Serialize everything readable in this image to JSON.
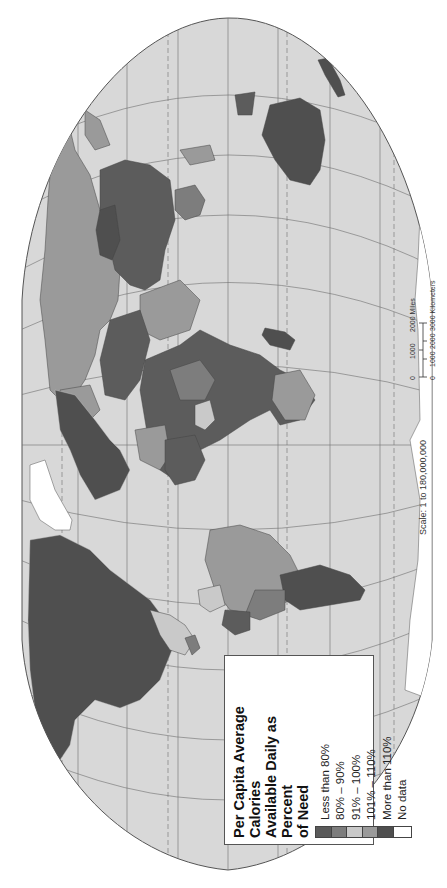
{
  "map": {
    "projection": "rotated equal-area world projection with graticule",
    "background_color": "#ffffff",
    "ocean_color": "#d8d8d8",
    "graticule_color": "#6a6a6a"
  },
  "legend": {
    "title": "Per Capita Average Calories Available Daily as Percent of Need",
    "title_lines": [
      "Per Capita Average Calories",
      "Available Daily as Percent",
      "of Need"
    ],
    "items": [
      {
        "label": "Less than 80%",
        "color": "#5a5a5a"
      },
      {
        "label": "80% – 90%",
        "color": "#7d7d7d"
      },
      {
        "label": "91% – 100%",
        "color": "#c9c9c9"
      },
      {
        "label": "101% – 110%",
        "color": "#9a9a9a"
      },
      {
        "label": "More than 110%",
        "color": "#4f4f4f"
      },
      {
        "label": "No data",
        "color": "#ffffff"
      }
    ]
  },
  "scale": {
    "ratio_text": "Scale: 1 to 180,000,000",
    "miles": {
      "ticks": [
        "0",
        "1000",
        "2000"
      ],
      "unit": "2000 Miles",
      "label": "Miles"
    },
    "kilometers": {
      "ticks": [
        "0",
        "1000",
        "2000",
        "3000"
      ],
      "unit": "3000 Kilometers",
      "label": "Kilometers"
    }
  }
}
